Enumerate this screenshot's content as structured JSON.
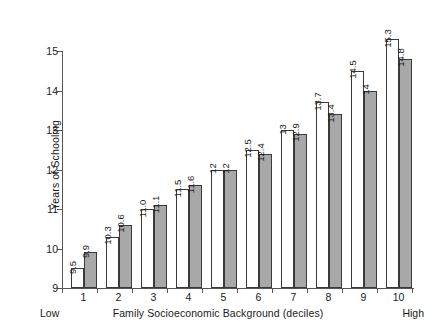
{
  "chart_data": {
    "type": "bar",
    "title": "",
    "subtitle": "",
    "xlabel": "Family Socioeconomic Background (deciles)",
    "ylabel": "Years of Schooling",
    "categories": [
      "1",
      "2",
      "3",
      "4",
      "5",
      "6",
      "7",
      "8",
      "9",
      "10"
    ],
    "series": [
      {
        "name": "white-bar",
        "values": [
          9.5,
          10.3,
          11.0,
          11.5,
          12,
          12.5,
          13,
          13.7,
          14.5,
          15.3
        ],
        "labels": [
          "9.5",
          "10.3",
          "11.0",
          "11.5",
          "12",
          "12.5",
          "13",
          "13.7",
          "14.5",
          "15.3"
        ],
        "color": "#ffffff"
      },
      {
        "name": "gray-bar",
        "values": [
          9.9,
          10.6,
          11.1,
          11.6,
          12,
          12.4,
          12.9,
          13.4,
          14,
          14.8
        ],
        "labels": [
          "9.9",
          "10.6",
          "11.1",
          "11.6",
          "12",
          "12.4",
          "12.9",
          "13.4",
          "14",
          "14.8"
        ],
        "color": "#a8a8a8"
      }
    ],
    "ylim": [
      9,
      15
    ],
    "yticks": [
      9,
      10,
      11,
      12,
      13,
      14,
      15
    ],
    "ytick_labels": [
      "9",
      "10",
      "11",
      "12",
      "13",
      "14",
      "15"
    ],
    "grid": false,
    "legend": "none",
    "annotations": {
      "axis_start": "Low",
      "axis_end": "High"
    }
  },
  "colors": {
    "bar_outline": "#3a3a3a",
    "axis": "#555555",
    "text": "#1a1a1a",
    "background": "#ffffff"
  }
}
